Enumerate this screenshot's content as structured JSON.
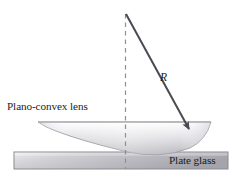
{
  "figure": {
    "width": 241,
    "height": 172,
    "background": "#ffffff"
  },
  "labels": {
    "lens": "Plano-convex lens",
    "plate": "Plate glass",
    "radius": "R"
  },
  "colors": {
    "stroke_dark": "#4a4a52",
    "dashed_line": "#8e8e96",
    "lens_edge": "#9a9aa2",
    "lens_fill_light": "#fafafa",
    "lens_fill_mid": "#d7d7db",
    "lens_fill_dark": "#b9b9bf",
    "plate_edge": "#8a8a90",
    "plate_fill_light": "#e7e7e9",
    "plate_fill_dark": "#a9a9af",
    "text": "#1c1c1c"
  },
  "geometry": {
    "center_of_curvature": {
      "x": 126,
      "y": 14
    },
    "contact_point": {
      "x": 124,
      "y": 151
    },
    "radius_arrow_tip": {
      "x": 191,
      "y": 131
    },
    "dashed_axis": {
      "x": 125,
      "y_top": 14,
      "y_bottom": 169
    },
    "lens": {
      "left_tip_x": 38,
      "right_tip_x": 211,
      "flat_top_y": 122,
      "lowest_y": 151
    },
    "plate": {
      "x": 14,
      "y": 152,
      "width": 214,
      "height": 17
    }
  },
  "icons": {
    "radius_arrow": "arrow-down-right-icon",
    "axis": "dashed-vertical-axis-icon"
  }
}
